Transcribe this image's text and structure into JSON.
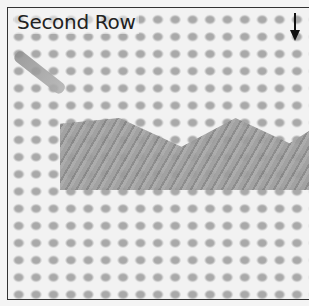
{
  "figure": {
    "title": "Second Row",
    "arrow": "down-arrow",
    "colors": {
      "background": "#f2f2f2",
      "canvas_holes": "#a9a9a9",
      "stitches": "#9c9c9c",
      "frame": "#333333",
      "text": "#222222"
    }
  }
}
